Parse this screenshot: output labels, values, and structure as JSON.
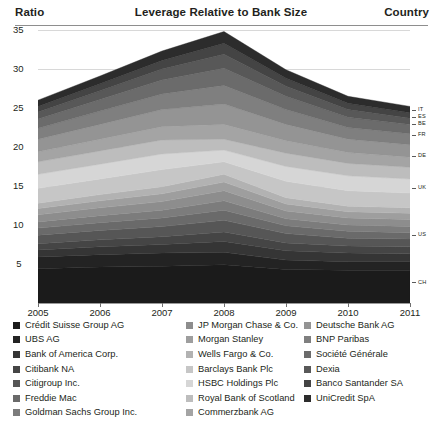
{
  "header": {
    "ratio_label": "Ratio",
    "title": "Leverage Relative to Bank Size",
    "country_label": "Country"
  },
  "axis": {
    "y_ticks": [
      "35",
      "30",
      "25",
      "20",
      "15",
      "10",
      "5"
    ],
    "x_ticks": [
      "2005",
      "2006",
      "2007",
      "2008",
      "2009",
      "2010",
      "2011"
    ],
    "country_codes": [
      "IT",
      "ES",
      "BE",
      "FR",
      "DE",
      "UK",
      "US",
      "CH"
    ]
  },
  "legend": {
    "column1": [
      {
        "label": "Crédit Suisse Group AG",
        "color": "#1b1b1b"
      },
      {
        "label": "UBS AG",
        "color": "#232323"
      },
      {
        "label": "Bank of America Corp.",
        "color": "#353535"
      },
      {
        "label": "Citibank NA",
        "color": "#454545"
      },
      {
        "label": "Citigroup Inc.",
        "color": "#565656"
      },
      {
        "label": "Freddie Mac",
        "color": "#6a6a6a"
      },
      {
        "label": "Goldman Sachs Group Inc.",
        "color": "#7c7c7c"
      }
    ],
    "column2": [
      {
        "label": "JP Morgan Chase & Co.",
        "color": "#8d8d8d"
      },
      {
        "label": "Morgan Stanley",
        "color": "#9e9e9e"
      },
      {
        "label": "Wells Fargo & Co.",
        "color": "#b2b2b2"
      },
      {
        "label": "Barclays Bank Plc",
        "color": "#c6c6c6"
      },
      {
        "label": "HSBC Holdings Plc",
        "color": "#d6d6d6"
      },
      {
        "label": "Royal Bank of Scotland",
        "color": "#bdbdbd"
      },
      {
        "label": "Commerzbank AG",
        "color": "#a4a4a4"
      }
    ],
    "column3": [
      {
        "label": "Deutsche Bank AG",
        "color": "#949494"
      },
      {
        "label": "BNP Paribas",
        "color": "#7f7f7f"
      },
      {
        "label": "Société Générale",
        "color": "#6b6b6b"
      },
      {
        "label": "Dexia",
        "color": "#585858"
      },
      {
        "label": "Banco Santander SA",
        "color": "#444444"
      },
      {
        "label": "UniCredit SpA",
        "color": "#2c2c2c"
      }
    ]
  },
  "chart_data": {
    "type": "area",
    "title": "Leverage Relative to Bank Size",
    "xlabel": "",
    "ylabel": "Ratio",
    "x": [
      2005,
      2006,
      2007,
      2008,
      2009,
      2010,
      2011
    ],
    "ylim": [
      0,
      35
    ],
    "grid": true,
    "stacked": true,
    "legend_position": "bottom",
    "country_groups": [
      "CH",
      "US",
      "UK",
      "DE",
      "FR",
      "BE",
      "ES",
      "IT"
    ],
    "series": [
      {
        "name": "Crédit Suisse Group AG",
        "country": "CH",
        "color": "#1b1b1b",
        "values": [
          4.4,
          4.6,
          4.7,
          4.9,
          4.3,
          4.2,
          4.2
        ]
      },
      {
        "name": "UBS AG",
        "country": "CH",
        "color": "#232323",
        "values": [
          1.5,
          1.6,
          1.7,
          1.6,
          1.2,
          1.1,
          1.1
        ]
      },
      {
        "name": "Bank of America Corp.",
        "country": "US",
        "color": "#353535",
        "values": [
          0.9,
          1.0,
          1.1,
          1.4,
          1.2,
          1.1,
          1.0
        ]
      },
      {
        "name": "Citibank NA",
        "country": "US",
        "color": "#454545",
        "values": [
          0.8,
          0.9,
          1.0,
          1.2,
          1.0,
          0.9,
          0.9
        ]
      },
      {
        "name": "Citigroup Inc.",
        "country": "US",
        "color": "#565656",
        "values": [
          1.1,
          1.2,
          1.3,
          1.5,
          1.2,
          1.0,
          1.0
        ]
      },
      {
        "name": "Freddie Mac",
        "country": "US",
        "color": "#6a6a6a",
        "values": [
          0.9,
          1.0,
          1.1,
          1.3,
          1.0,
          0.9,
          0.8
        ]
      },
      {
        "name": "Goldman Sachs Group Inc.",
        "country": "US",
        "color": "#7c7c7c",
        "values": [
          0.8,
          0.9,
          1.0,
          1.2,
          0.9,
          0.8,
          0.8
        ]
      },
      {
        "name": "JP Morgan Chase & Co.",
        "country": "US",
        "color": "#8d8d8d",
        "values": [
          0.9,
          1.0,
          1.1,
          1.3,
          1.0,
          0.9,
          0.9
        ]
      },
      {
        "name": "Morgan Stanley",
        "country": "US",
        "color": "#9e9e9e",
        "values": [
          0.8,
          0.9,
          1.0,
          1.1,
          0.9,
          0.8,
          0.8
        ]
      },
      {
        "name": "Wells Fargo & Co.",
        "country": "US",
        "color": "#b2b2b2",
        "values": [
          0.7,
          0.8,
          0.9,
          1.0,
          0.8,
          0.7,
          0.7
        ]
      },
      {
        "name": "Barclays Bank Plc",
        "country": "UK",
        "color": "#c6c6c6",
        "values": [
          1.9,
          2.0,
          2.2,
          1.6,
          2.1,
          2.0,
          1.9
        ]
      },
      {
        "name": "HSBC Holdings Plc",
        "country": "UK",
        "color": "#d6d6d6",
        "values": [
          1.8,
          1.9,
          2.0,
          1.5,
          1.9,
          1.9,
          1.8
        ]
      },
      {
        "name": "Royal Bank of Scotland",
        "country": "UK",
        "color": "#bdbdbd",
        "values": [
          1.6,
          1.7,
          1.8,
          1.4,
          1.7,
          1.6,
          1.5
        ]
      },
      {
        "name": "Commerzbank AG",
        "country": "DE",
        "color": "#a4a4a4",
        "values": [
          1.3,
          1.5,
          1.7,
          1.9,
          1.6,
          1.4,
          1.3
        ]
      },
      {
        "name": "Deutsche Bank AG",
        "country": "DE",
        "color": "#949494",
        "values": [
          1.6,
          1.9,
          2.2,
          2.6,
          2.1,
          1.7,
          1.6
        ]
      },
      {
        "name": "BNP Paribas",
        "country": "FR",
        "color": "#7f7f7f",
        "values": [
          1.4,
          1.7,
          2.0,
          2.4,
          1.9,
          1.5,
          1.4
        ]
      },
      {
        "name": "Société Générale",
        "country": "FR",
        "color": "#6b6b6b",
        "values": [
          1.2,
          1.5,
          1.8,
          2.2,
          1.7,
          1.3,
          1.2
        ]
      },
      {
        "name": "Dexia",
        "country": "BE",
        "color": "#585858",
        "values": [
          0.9,
          1.1,
          1.4,
          1.8,
          1.3,
          1.0,
          0.8
        ]
      },
      {
        "name": "Banco Santander SA",
        "country": "ES",
        "color": "#444444",
        "values": [
          0.7,
          0.9,
          1.1,
          1.4,
          1.0,
          0.8,
          0.7
        ]
      },
      {
        "name": "UniCredit SpA",
        "country": "IT",
        "color": "#2c2c2c",
        "values": [
          0.8,
          1.0,
          1.2,
          1.5,
          1.1,
          0.9,
          0.8
        ]
      }
    ],
    "totals": [
      24.0,
      26.1,
      28.3,
      31.8,
      27.9,
      24.5,
      23.2
    ]
  }
}
